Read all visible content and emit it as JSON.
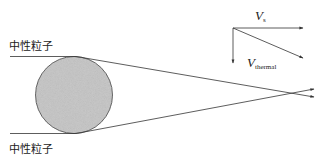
{
  "diagram": {
    "particle_label_top": "中性粒子",
    "particle_label_bottom": "中性粒子",
    "velocity_labels": {
      "vs_main": "V",
      "vs_sub": "s",
      "vthermal_main": "V",
      "vthermal_sub": "thermal"
    },
    "colors": {
      "circle_fill": "#c4c4c4",
      "circle_stroke": "#444444",
      "line": "#333333",
      "background": "#ffffff"
    }
  }
}
